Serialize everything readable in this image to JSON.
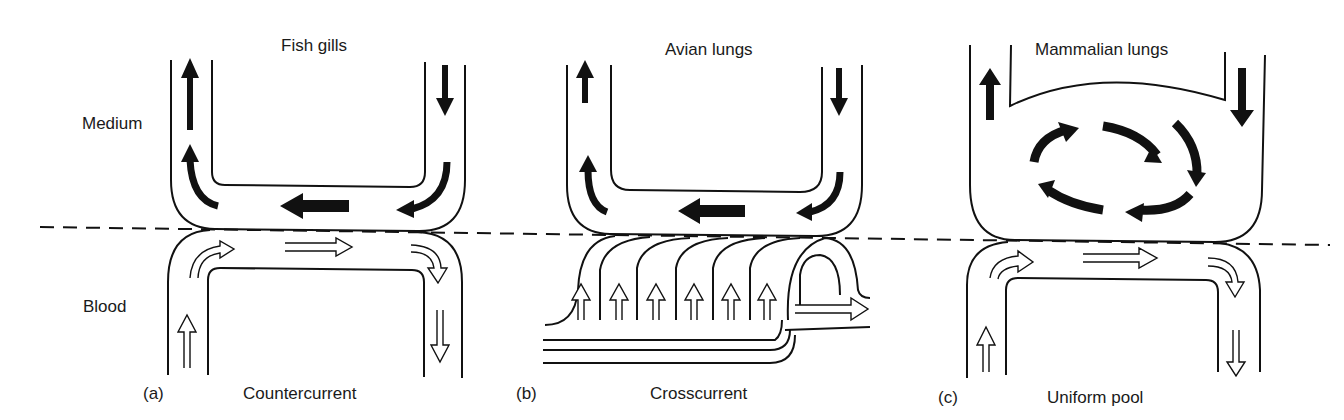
{
  "figure": {
    "side_labels": {
      "medium": "Medium",
      "blood": "Blood"
    },
    "panels": [
      {
        "letter": "(a)",
        "title": "Fish gills",
        "caption": "Countercurrent"
      },
      {
        "letter": "(b)",
        "title": "Avian lungs",
        "caption": "Crosscurrent"
      },
      {
        "letter": "(c)",
        "title": "Mammalian lungs",
        "caption": "Uniform pool"
      }
    ]
  },
  "colors": {
    "stroke": "#111111",
    "background": "#ffffff",
    "arrow_fill": "#111111",
    "blood_arrow_fill": "#ffffff"
  }
}
